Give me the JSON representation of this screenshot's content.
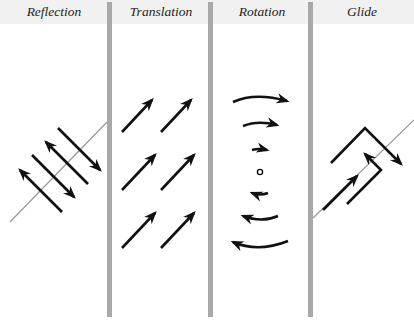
{
  "diagram": {
    "panels": [
      {
        "id": "reflection",
        "title": "Reflection"
      },
      {
        "id": "translation",
        "title": "Translation"
      },
      {
        "id": "rotation",
        "title": "Rotation"
      },
      {
        "id": "glide",
        "title": "Glide"
      }
    ],
    "colors": {
      "header_band": "#f1f1f1",
      "divider": "#a8a8a8",
      "arrow": "#111111",
      "mirror_line": "#999999"
    }
  }
}
